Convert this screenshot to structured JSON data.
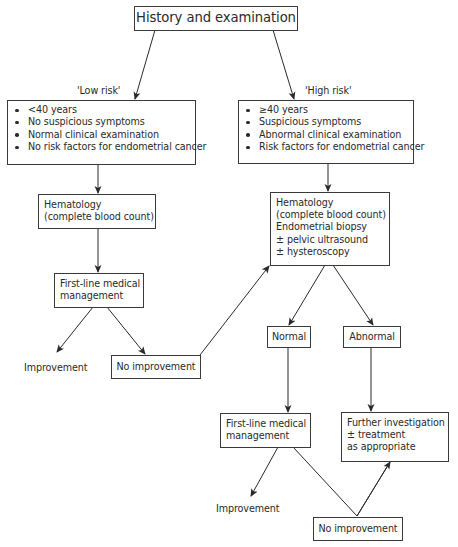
{
  "diagram": {
    "title": "History and examination",
    "branches": {
      "low_risk": {
        "label": "'Low risk'",
        "criteria": [
          "<40 years",
          "No suspicious symptoms",
          "Normal clinical examination",
          "No risk factors for endometrial cancer"
        ],
        "hematology": [
          "Hematology",
          "(complete blood count)"
        ],
        "first_line": [
          "First-line medical",
          "management"
        ],
        "improvement": "Improvement",
        "no_improvement": "No improvement"
      },
      "high_risk": {
        "label": "'High risk'",
        "criteria": [
          "≥40 years",
          "Suspicious symptoms",
          "Abnormal clinical examination",
          "Risk factors for endometrial cancer"
        ],
        "investigations": [
          "Hematology",
          "(complete blood count)",
          "Endometrial biopsy",
          "± pelvic ultrasound",
          "± hysteroscopy"
        ],
        "normal": "Normal",
        "abnormal": "Abnormal",
        "first_line": [
          "First-line medical",
          "management"
        ],
        "further": [
          "Further investigation",
          "± treatment",
          "as appropriate"
        ],
        "improvement": "Improvement",
        "no_improvement": "No improvement"
      }
    },
    "colors": {
      "line": "#2a2a2a",
      "text": "#2a2a2a",
      "background": "#ffffff"
    }
  }
}
